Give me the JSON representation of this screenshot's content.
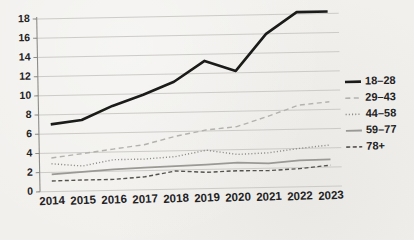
{
  "window": {
    "background_color": "#f1f0ed",
    "description": "Line chart of values by age group, 2014-2023"
  },
  "chart_data": {
    "type": "line",
    "title": "",
    "xlabel": "",
    "ylabel": "",
    "categories": [
      "2014",
      "2015",
      "2016",
      "2017",
      "2018",
      "2019",
      "2020",
      "2021",
      "2022",
      "2023"
    ],
    "y_ticks": [
      "0",
      "2",
      "4",
      "6",
      "8",
      "10",
      "12",
      "14",
      "16",
      "18"
    ],
    "ylim": [
      0,
      18
    ],
    "grid": true,
    "grid_color": "#c9c7c3",
    "axis_color": "#8e8c88",
    "legend_position": "right",
    "series": [
      {
        "name": "18–28",
        "line_style": "solid",
        "color": "#1b1b19",
        "width": 2.6,
        "values": [
          7.0,
          7.4,
          8.8,
          9.9,
          11.2,
          13.3,
          12.2,
          16.0,
          18.2,
          18.2
        ]
      },
      {
        "name": "29–43",
        "line_style": "dashed",
        "color": "#b4b2ae",
        "width": 1.4,
        "values": [
          3.5,
          3.9,
          4.3,
          4.7,
          5.5,
          6.1,
          6.4,
          7.4,
          8.5,
          8.8
        ]
      },
      {
        "name": "44–58",
        "line_style": "dotted",
        "color": "#8e8c88",
        "width": 1.4,
        "values": [
          2.9,
          2.6,
          3.2,
          3.2,
          3.4,
          4.0,
          3.5,
          3.6,
          4.0,
          4.3
        ]
      },
      {
        "name": "59–77",
        "line_style": "solid",
        "color": "#9b9995",
        "width": 1.8,
        "values": [
          1.8,
          2.0,
          2.2,
          2.3,
          2.4,
          2.5,
          2.65,
          2.5,
          2.75,
          2.8
        ]
      },
      {
        "name": "78+",
        "line_style": "dashed-short",
        "color": "#54524e",
        "width": 1.4,
        "values": [
          1.1,
          1.15,
          1.15,
          1.35,
          1.9,
          1.7,
          1.8,
          1.75,
          1.9,
          2.2
        ]
      }
    ]
  }
}
